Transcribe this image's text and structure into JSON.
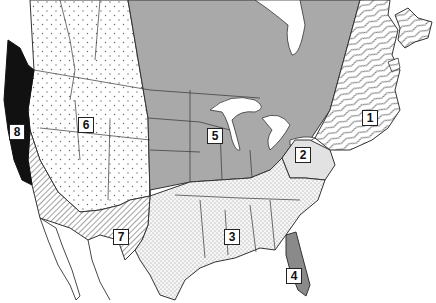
{
  "map": {
    "title": "North America regions",
    "regions": [
      {
        "id": "1",
        "label": "1",
        "pattern": "wavy-lines",
        "fill": "#ffffff",
        "x": 362,
        "y": 110
      },
      {
        "id": "2",
        "label": "2",
        "pattern": "light-gray",
        "fill": "#e2e2e2",
        "x": 295,
        "y": 147
      },
      {
        "id": "3",
        "label": "3",
        "pattern": "fine-dots",
        "fill": "#f4f4f4",
        "x": 224,
        "y": 229
      },
      {
        "id": "4",
        "label": "4",
        "pattern": "medium-gray",
        "fill": "#8a8a8a",
        "x": 286,
        "y": 268
      },
      {
        "id": "5",
        "label": "5",
        "pattern": "solid-gray",
        "fill": "#a9a9a9",
        "x": 207,
        "y": 128
      },
      {
        "id": "6",
        "label": "6",
        "pattern": "sparse-dots",
        "fill": "#ffffff",
        "x": 78,
        "y": 117
      },
      {
        "id": "7",
        "label": "7",
        "pattern": "diagonal-hatch",
        "fill": "#ffffff",
        "x": 113,
        "y": 229
      },
      {
        "id": "8",
        "label": "8",
        "pattern": "solid-black",
        "fill": "#111111",
        "x": 9,
        "y": 124
      }
    ]
  }
}
